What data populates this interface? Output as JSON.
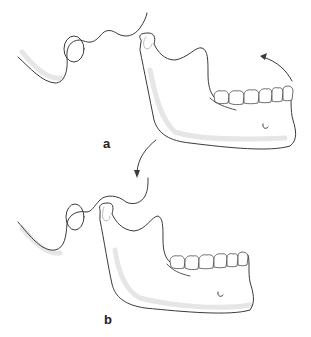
{
  "figure": {
    "type": "anatomical-diagram",
    "panels": [
      {
        "id": "a",
        "label": "a",
        "description": "mandible rotated open, condyle in glenoid fossa region",
        "arrow": "curved arrow at chin indicating upward rotation"
      },
      {
        "id": "b",
        "label": "b",
        "description": "mandible with condyle translated forward onto articular eminence",
        "arrow": "curved arrow indicating downward/forward translation"
      }
    ]
  },
  "colors": {
    "line": "#3a3a3a",
    "shade": "#e6e6e6",
    "background": "#ffffff",
    "label": "#222222"
  }
}
